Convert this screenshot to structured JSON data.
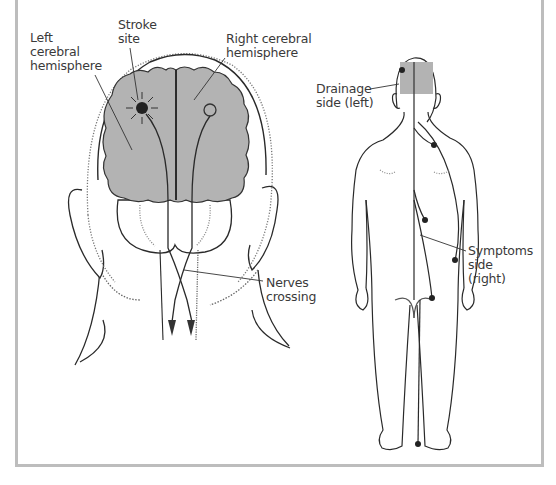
{
  "figure": {
    "left_panel": {
      "name": "head-back-view",
      "labels": {
        "left_hemisphere": "Left\ncerebral\nhemisphere",
        "stroke_site": "Stroke\nsite",
        "right_hemisphere": "Right cerebral\nhemisphere",
        "nerves_crossing": "Nerves\ncrossing"
      }
    },
    "right_panel": {
      "name": "body-back-view",
      "labels": {
        "drainage_side": "Drainage\nside (left)",
        "symptoms_side": "Symptoms\nside\n(right)"
      }
    }
  },
  "colors": {
    "brain_fill": "#b3b3b3",
    "line": "#2a2a2a",
    "frame": "#bdbdbd",
    "stroke_dot": "#222222",
    "text": "#3a3a3a"
  }
}
